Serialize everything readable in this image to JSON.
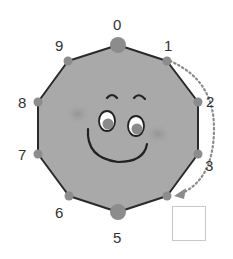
{
  "diagram": {
    "type": "decagon-number-dial",
    "colors": {
      "face_fill": "#a9a9a9",
      "outline": "#2a2a2a",
      "vertex_dot": "#8c8c8c",
      "arrow": "#8c8c8c",
      "label": "#333333",
      "answer_box_border": "#c8c8c8"
    },
    "vertices": [
      {
        "label": "0",
        "x": 118,
        "y": 45,
        "big": true
      },
      {
        "label": "1",
        "x": 167,
        "y": 61,
        "big": false
      },
      {
        "label": "2",
        "x": 198,
        "y": 102,
        "big": false
      },
      {
        "label": "3",
        "x": 198,
        "y": 154,
        "big": false
      },
      {
        "label": "",
        "x": 167,
        "y": 196,
        "big": false
      },
      {
        "label": "5",
        "x": 118,
        "y": 212,
        "big": true
      },
      {
        "label": "6",
        "x": 69,
        "y": 196,
        "big": false
      },
      {
        "label": "7",
        "x": 38,
        "y": 154,
        "big": false
      },
      {
        "label": "8",
        "x": 38,
        "y": 102,
        "big": false
      },
      {
        "label": "9",
        "x": 68,
        "y": 61,
        "big": false
      }
    ],
    "arrow": {
      "from": "1",
      "to": "4",
      "style": "dotted",
      "note": "counting steps clockwise"
    },
    "answer_box": {
      "value": ""
    }
  },
  "labels": {
    "l0": "0",
    "l1": "1",
    "l2": "2",
    "l3": "3",
    "l5": "5",
    "l6": "6",
    "l7": "7",
    "l8": "8",
    "l9": "9"
  }
}
